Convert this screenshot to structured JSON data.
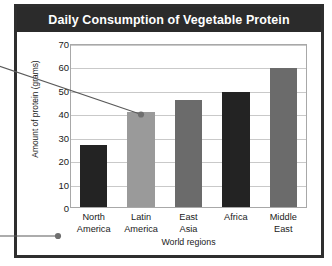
{
  "figure": {
    "title": "Daily Consumption of Vegetable Protein",
    "title_bg": "#2b2b2b",
    "title_color": "#ffffff",
    "frame_color": "#2e2e2e",
    "background": "#ffffff"
  },
  "annotations": {
    "leader_top": {
      "name": "leader-line-to-latin-america-bar",
      "dot_color": "#6f6f6f"
    },
    "leader_bottom": {
      "name": "leader-line-to-x-axis-labels",
      "dot_color": "#6f6f6f"
    }
  },
  "chart_data": {
    "type": "bar",
    "title": "Daily Consumption of Vegetable Protein",
    "xlabel": "World regions",
    "ylabel": "Amount of protein (grams)",
    "categories": [
      "North America",
      "Latin America",
      "East Asia",
      "Africa",
      "Middle East"
    ],
    "category_lines": [
      [
        "North",
        "America"
      ],
      [
        "Latin",
        "America"
      ],
      [
        "East",
        "Asia"
      ],
      [
        "Africa",
        ""
      ],
      [
        "Middle",
        "East"
      ]
    ],
    "values": [
      26.5,
      40.5,
      45.5,
      49,
      59.5
    ],
    "bar_colors": [
      "#232323",
      "#9a9a9a",
      "#6b6b6b",
      "#232323",
      "#6b6b6b"
    ],
    "ylim": [
      0,
      70
    ],
    "yticks": [
      0,
      10,
      20,
      30,
      40,
      50,
      60,
      70
    ],
    "ytick_labels": [
      "0",
      "10",
      "20",
      "30",
      "40",
      "50",
      "60",
      "70"
    ],
    "grid": true,
    "grid_color": "#c9c9c9",
    "legend": null,
    "legend_position": "none"
  }
}
